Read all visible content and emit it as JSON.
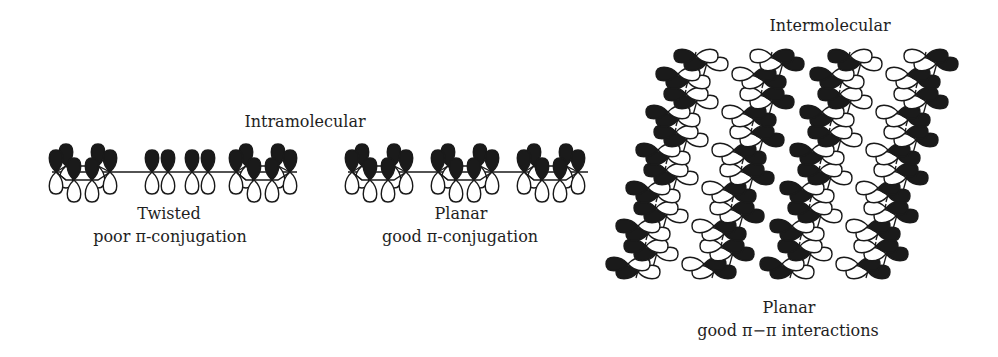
{
  "figure": {
    "intramolecular_heading": "Intramolecular",
    "intermolecular_heading": "Intermolecular",
    "twisted": {
      "title": "Twisted",
      "subtitle": "poor π-conjugation"
    },
    "planar_intra": {
      "title": "Planar",
      "subtitle": "good π-conjugation"
    },
    "planar_inter": {
      "title": "Planar",
      "subtitle": "good π−π interactions"
    }
  },
  "colors": {
    "ink": "#1a1a1a",
    "background": "#ffffff"
  },
  "structure": {
    "twisted_chain": {
      "rings_end": 2,
      "single_orbitals_middle": 4
    },
    "planar_chain": {
      "rings": 3
    },
    "stacked_chains": {
      "count": 4,
      "segments_per_chain": 6,
      "tilt_deg": 18
    }
  }
}
